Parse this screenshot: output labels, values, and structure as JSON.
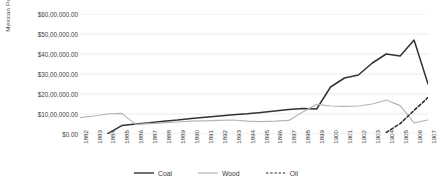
{
  "chart_data": {
    "type": "line",
    "title": "",
    "xlabel": "",
    "ylabel": "Mexican Pesos",
    "ylim": [
      0,
      6000000
    ],
    "ytick_labels": [
      "$60,00,000.00",
      "$50,00,000.00",
      "$40,00,000.00",
      "$30,00,000.00",
      "$20,00,000.00",
      "$10,00,000.00",
      "$0.00"
    ],
    "ytick_values": [
      6000000,
      5000000,
      4000000,
      3000000,
      2000000,
      1000000,
      0
    ],
    "grid": true,
    "legend_position": "bottom",
    "categories": [
      "1882",
      "1883",
      "1884",
      "1885",
      "1886",
      "1887",
      "1888",
      "1889",
      "1890",
      "1891",
      "1892",
      "1893",
      "1894",
      "1895",
      "1896",
      "1897",
      "1898",
      "1899",
      "1900",
      "1901",
      "1902",
      "1903",
      "1904",
      "1905",
      "1906",
      "1907"
    ],
    "series": [
      {
        "name": "Coal",
        "color": "#333333",
        "style": "solid",
        "values": [
          null,
          null,
          20000,
          420000,
          500000,
          560000,
          640000,
          700000,
          780000,
          840000,
          900000,
          960000,
          1010000,
          1080000,
          1150000,
          1220000,
          1280000,
          1250000,
          2350000,
          2800000,
          2950000,
          3550000,
          4000000,
          3900000,
          4700000,
          2500000
        ]
      },
      {
        "name": "Wood",
        "color": "#b5b5b5",
        "style": "solid",
        "values": [
          820000,
          900000,
          1000000,
          1030000,
          480000,
          520000,
          560000,
          600000,
          640000,
          660000,
          680000,
          700000,
          640000,
          620000,
          640000,
          680000,
          1100000,
          1480000,
          1400000,
          1380000,
          1400000,
          1500000,
          1700000,
          1420000,
          560000,
          700000
        ]
      },
      {
        "name": "Oil",
        "color": "#2b2b2b",
        "style": "dashed",
        "values": [
          null,
          null,
          null,
          null,
          null,
          null,
          null,
          null,
          null,
          null,
          null,
          null,
          null,
          null,
          null,
          null,
          null,
          null,
          null,
          null,
          null,
          null,
          80000,
          520000,
          1180000,
          1820000
        ]
      }
    ]
  },
  "legend": {
    "items": [
      {
        "label": "Coal"
      },
      {
        "label": "Wood"
      },
      {
        "label": "Oil"
      }
    ]
  }
}
